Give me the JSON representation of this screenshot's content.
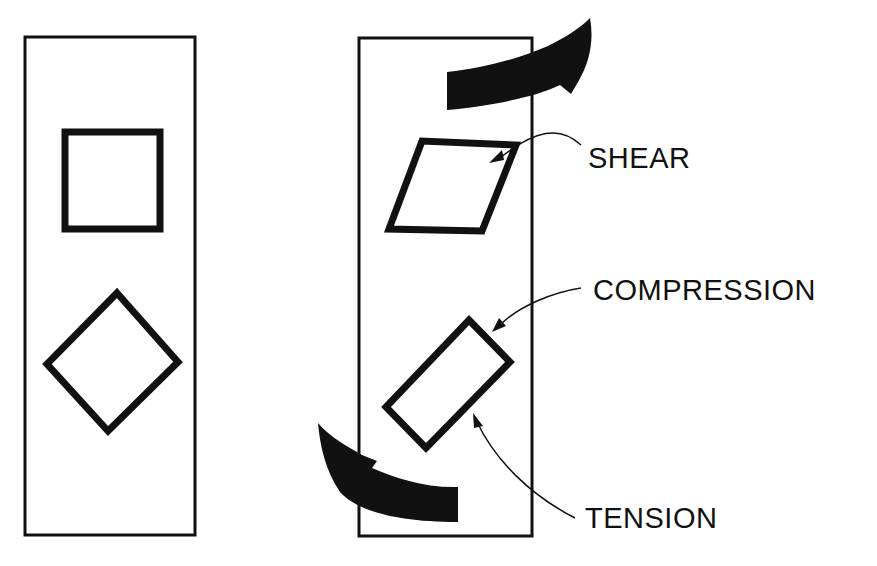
{
  "diagram": {
    "title": "",
    "colors": {
      "ink": "#111111",
      "background": "#ffffff"
    },
    "panels": [
      {
        "id": "unstressed",
        "shapes": [
          "square",
          "diamond"
        ]
      },
      {
        "id": "sheared",
        "shapes": [
          "parallelogram",
          "rotated-rectangle"
        ],
        "arrows": [
          "top-shear-arrow",
          "bottom-shear-arrow"
        ]
      }
    ],
    "labels": {
      "shear": "SHEAR",
      "compression": "COMPRESSION",
      "tension": "TENSION"
    }
  }
}
